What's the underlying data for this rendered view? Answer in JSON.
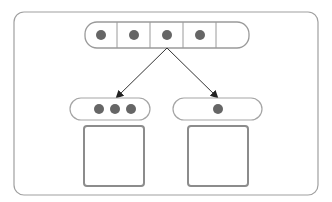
{
  "diagram": {
    "source_array": {
      "slots": 5,
      "filled": [
        true,
        true,
        true,
        true,
        false
      ]
    },
    "partitions": [
      {
        "name": "left",
        "items": 3
      },
      {
        "name": "right",
        "items": 1
      }
    ],
    "colors": {
      "stroke": "#9a9a9a",
      "box_stroke": "#8c8c8c",
      "dot": "#666666",
      "arrow": "#333333",
      "background": "#ffffff"
    }
  }
}
